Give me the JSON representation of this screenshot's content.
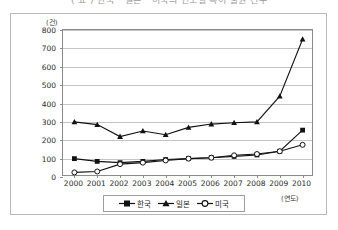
{
  "title": "( 표 ) 한국 · 일본 · 미국의 연도별 특허 출원 건수",
  "axes": {
    "y_unit": "(건)",
    "x_unit": "(연도)",
    "y_ticks": [
      "800",
      "700",
      "600",
      "500",
      "400",
      "300",
      "200",
      "100",
      "0"
    ]
  },
  "legend": {
    "items": [
      {
        "label": "한국",
        "marker": "filled-square-marker",
        "color": "#111111"
      },
      {
        "label": "일본",
        "marker": "filled-triangle-marker",
        "color": "#111111"
      },
      {
        "label": "미국",
        "marker": "open-circle-marker",
        "color": "#111111"
      }
    ]
  },
  "chart_data": {
    "type": "line",
    "title": "( 표 ) 한국 · 일본 · 미국의 연도별 특허 출원 건수",
    "xlabel": "(연도)",
    "ylabel": "(건)",
    "ylim": [
      0,
      800
    ],
    "ytick_step": 100,
    "grid": true,
    "legend_position": "bottom",
    "categories": [
      "2000",
      "2001",
      "2002",
      "2003",
      "2004",
      "2005",
      "2006",
      "2007",
      "2008",
      "2009",
      "2010"
    ],
    "series": [
      {
        "name": "한국",
        "marker": "filled-square-marker",
        "values": [
          100,
          85,
          78,
          85,
          95,
          100,
          105,
          112,
          120,
          140,
          255
        ]
      },
      {
        "name": "일본",
        "marker": "filled-triangle-marker",
        "values": [
          300,
          285,
          220,
          250,
          230,
          270,
          288,
          295,
          300,
          440,
          750
        ]
      },
      {
        "name": "미국",
        "marker": "open-circle-marker",
        "values": [
          25,
          30,
          70,
          78,
          90,
          100,
          105,
          118,
          125,
          140,
          175
        ]
      }
    ]
  }
}
